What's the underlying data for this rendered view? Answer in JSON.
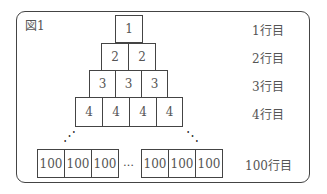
{
  "figure": {
    "label": "図1",
    "rows": [
      {
        "label": "1行目",
        "values": [
          "1"
        ]
      },
      {
        "label": "2行目",
        "values": [
          "2",
          "2"
        ]
      },
      {
        "label": "3行目",
        "values": [
          "3",
          "3",
          "3"
        ]
      },
      {
        "label": "4行目",
        "values": [
          "4",
          "4",
          "4",
          "4"
        ]
      }
    ],
    "last_row": {
      "label": "100行目",
      "left_values": [
        "100",
        "100",
        "100"
      ],
      "ellipsis": "…",
      "right_values": [
        "100",
        "100",
        "100"
      ]
    },
    "vertical_dots": "⋰",
    "vertical_dots_right": "⋱"
  }
}
